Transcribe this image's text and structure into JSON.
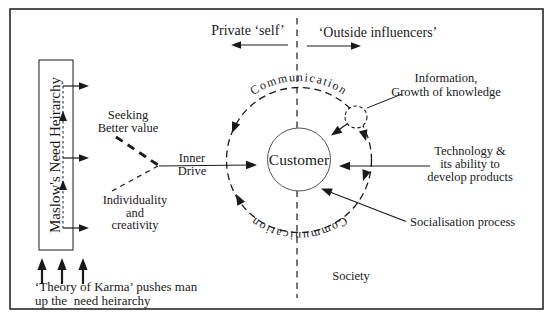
{
  "colors": {
    "ink": "#1a1a1a",
    "background": "#ffffff"
  },
  "labels": {
    "private_self": "Private ‘self’",
    "outside_influencers": "‘Outside influencers’",
    "communication_top": "Communication",
    "communication_bottom": "Communication",
    "customer": "Customer",
    "information": "Information,\nGrowth of knowledge",
    "technology": "Technology &\nits ability to\ndevelop products",
    "socialisation": "Socialisation process",
    "society": "Society",
    "seeking": "Seeking\nBetter value",
    "inner_drive": "Inner\nDrive",
    "individuality": "Individuality\nand\ncreativity",
    "maslow_box": "Maslow's Need Heirarchy",
    "karma": "‘Theory of Karma’ pushes man\nup the  need heirarchy"
  }
}
